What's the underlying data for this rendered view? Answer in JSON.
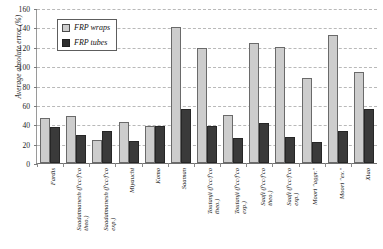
{
  "chart": {
    "type": "bar",
    "title": "",
    "xlabel": "",
    "ylabel": "Average absolute error (%)"
  },
  "legend": {
    "position": "top-left",
    "items": [
      {
        "label": "FRP wraps",
        "color": "#cdcdcd",
        "key": "wraps"
      },
      {
        "label": "FRP tubes",
        "color": "#2e2e2e",
        "key": "tubes"
      }
    ]
  },
  "yaxis": {
    "min": 0,
    "max": 160,
    "step": 20,
    "ticks": [
      "0",
      "20",
      "40",
      "60",
      "80",
      "100",
      "120",
      "140",
      "160"
    ]
  },
  "chart_data": {
    "type": "bar",
    "title": "",
    "xlabel": "",
    "ylabel": "Average absolute error (%)",
    "ylim": [
      0,
      160
    ],
    "ytick_step": 20,
    "grid": true,
    "legend_position": "top-left",
    "categories": [
      "Fardis",
      "Saadatmanesh (f'cc/f'co theo.)",
      "Saadatmanesh (f'cc/f'co exp.)",
      "Miyauchi",
      "Komo",
      "Saaman",
      "Toutanji (f'cc/f'co theo.)",
      "Toutanji (f'cc/f'co exp.)",
      "Saafi (f'cc/f'co theo.)",
      "Saafi (f'cc/f'co exp.)",
      "Moori \"aggr.\"",
      "Moori \"ex.\"",
      "Xiao"
    ],
    "series": [
      {
        "name": "FRP wraps",
        "color": "#cdcdcd",
        "values": [
          46,
          49,
          24,
          42,
          38,
          140,
          119,
          50,
          124,
          120,
          88,
          132,
          94
        ]
      },
      {
        "name": "FRP tubes",
        "color": "#2e2e2e",
        "values": [
          37,
          29,
          33,
          23,
          38,
          56,
          38,
          26,
          41,
          27,
          22,
          33,
          56
        ]
      }
    ]
  },
  "categories_display": [
    {
      "line1": "Fardis",
      "line2": ""
    },
    {
      "line1": "Saadatmanesh (f'cc/f'co",
      "line2": "theo.)"
    },
    {
      "line1": "Saadatmanesh (f'cc/f'co",
      "line2": "exp.)"
    },
    {
      "line1": "Miyauchi",
      "line2": ""
    },
    {
      "line1": "Komo",
      "line2": ""
    },
    {
      "line1": "Saaman",
      "line2": ""
    },
    {
      "line1": "Toutanji (f'cc/f'co",
      "line2": "theo.)"
    },
    {
      "line1": "Toutanji (f'cc/f'co",
      "line2": "exp.)"
    },
    {
      "line1": "Saafi (f'cc/f'co",
      "line2": "theo.)"
    },
    {
      "line1": "Saafi (f'cc/f'co",
      "line2": "exp.)"
    },
    {
      "line1": "Moori \"aggr.\"",
      "line2": ""
    },
    {
      "line1": "Moori \"ex.\"",
      "line2": ""
    },
    {
      "line1": "Xiao",
      "line2": ""
    }
  ]
}
